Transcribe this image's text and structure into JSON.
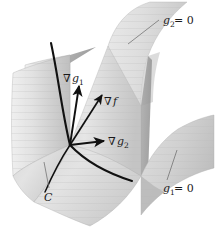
{
  "figure": {
    "background_color": "#ffffff",
    "line_color": "#1a1a1a"
  },
  "labels": {
    "g2_surface": {
      "nabla": "",
      "base": "g",
      "sub": "2",
      "rest": " = 0"
    },
    "g1_surface": {
      "nabla": "",
      "base": "g",
      "sub": "1",
      "rest": " = 0"
    },
    "grad_g1": {
      "nabla": "∇",
      "base": "g",
      "sub": "1",
      "rest": ""
    },
    "grad_f": {
      "nabla": "∇",
      "base": "f",
      "sub": "",
      "rest": ""
    },
    "grad_g2": {
      "nabla": "∇",
      "base": "g",
      "sub": "2",
      "rest": ""
    },
    "curve_c": {
      "nabla": "",
      "base": "C",
      "sub": "",
      "rest": ""
    }
  },
  "label_text": {
    "g2_surface_full": "g2 = 0",
    "g1_surface_full": "g1 = 0",
    "grad_g1_full": "∇g1",
    "grad_f_full": "∇f",
    "grad_g2_full": "∇g2",
    "curve_c_full": "C"
  },
  "vectors": [
    {
      "name": "grad_g1",
      "label": "∇g1",
      "origin": [
        70,
        145
      ],
      "tip": [
        79,
        84
      ]
    },
    {
      "name": "grad_f",
      "label": "∇f",
      "origin": [
        70,
        145
      ],
      "tip": [
        104,
        93
      ]
    },
    {
      "name": "grad_g2",
      "label": "∇g2",
      "origin": [
        70,
        145
      ],
      "tip": [
        107,
        141
      ]
    }
  ],
  "surfaces": [
    {
      "name": "g1-surface",
      "label": "g1 = 0",
      "shade_light": "#ebebeb",
      "shade_mid": "#d2d2d2",
      "shade_dark": "#b0b0b0"
    },
    {
      "name": "g2-surface",
      "label": "g2 = 0",
      "shade_light": "#f0f0f0",
      "shade_mid": "#d8d8d8",
      "shade_dark": "#bdbdbd"
    }
  ],
  "curve": {
    "name": "intersection-curve",
    "label": "C",
    "color": "#111111",
    "width": 2.1
  },
  "leaders": [
    {
      "name": "leader-g2",
      "from": [
        163,
        18
      ],
      "to": [
        128,
        45
      ]
    },
    {
      "name": "leader-g1",
      "from": [
        166,
        183
      ],
      "to": [
        178,
        152
      ]
    },
    {
      "name": "leader-c",
      "from": [
        49,
        190
      ],
      "to": [
        43,
        163
      ]
    }
  ]
}
